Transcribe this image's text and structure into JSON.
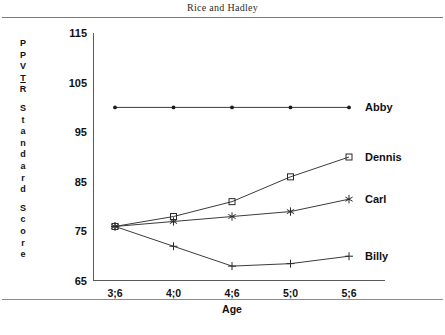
{
  "page": {
    "running_head": "Rice and Hadley"
  },
  "chart_data": {
    "type": "line",
    "title": "",
    "xlabel": "Age",
    "ylabel": "PPVT-R Standard Score",
    "ylabel_letters": [
      "P",
      "P",
      "V",
      "T",
      "R",
      "",
      "S",
      "t",
      "a",
      "n",
      "d",
      "a",
      "r",
      "d",
      "",
      "S",
      "c",
      "o",
      "r",
      "e"
    ],
    "categories": [
      "3;6",
      "4;0",
      "4;6",
      "5;0",
      "5;6"
    ],
    "x": [
      "3;6",
      "4;0",
      "4;6",
      "5;0",
      "5;6"
    ],
    "yticks": [
      65,
      75,
      85,
      95,
      105,
      115
    ],
    "ylim": [
      65,
      115
    ],
    "grid": false,
    "legend_position": "right-of-line-ends",
    "series": [
      {
        "name": "Abby",
        "marker": "dot",
        "values": [
          100,
          100,
          100,
          100,
          100
        ],
        "label": "Abby"
      },
      {
        "name": "Dennis",
        "marker": "square",
        "values": [
          76,
          78,
          81,
          86,
          90
        ],
        "label": "Dennis"
      },
      {
        "name": "Carl",
        "marker": "asterisk",
        "values": [
          76,
          77,
          78,
          79,
          81.5
        ],
        "label": "Carl"
      },
      {
        "name": "Billy",
        "marker": "plus",
        "values": [
          76,
          72,
          68,
          68.5,
          70
        ],
        "label": "Billy"
      }
    ]
  }
}
